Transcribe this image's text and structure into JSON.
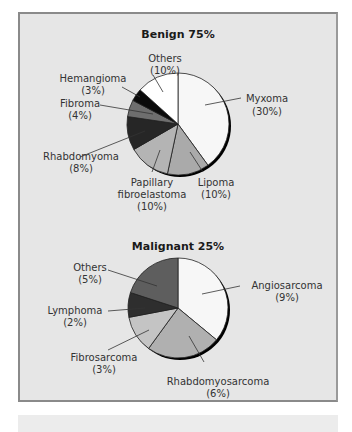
{
  "chart_data": [
    {
      "type": "pie",
      "title": "Benign 75%",
      "start_angle": "12 o'clock, clockwise",
      "categories": [
        "Myxoma",
        "Lipoma",
        "Papillary fibroelastoma",
        "Rhabdomyoma",
        "Fibroma",
        "Hemangioma",
        "Others"
      ],
      "values": [
        30,
        10,
        10,
        8,
        4,
        3,
        10
      ],
      "labels": [
        "(30%)",
        "(10%)",
        "(10%)",
        "(8%)",
        "(4%)",
        "(3%)",
        "(10%)"
      ],
      "colors": [
        "#f7f7f7",
        "#aaaaaa",
        "#b4b4b4",
        "#262626",
        "#6e6e6e",
        "#0a0a0a",
        "#ffffff"
      ]
    },
    {
      "type": "pie",
      "title": "Malignant 25%",
      "start_angle": "12 o'clock, clockwise",
      "categories": [
        "Angiosarcoma",
        "Rhabdomyosarcoma",
        "Fibrosarcoma",
        "Lymphoma",
        "Others"
      ],
      "values": [
        9,
        6,
        3,
        2,
        5
      ],
      "labels": [
        "(9%)",
        "(6%)",
        "(3%)",
        "(2%)",
        "(5%)"
      ],
      "colors": [
        "#f7f7f7",
        "#b0b0b0",
        "#c4c4c4",
        "#2e2e2e",
        "#5e5e5e"
      ]
    }
  ],
  "benign": {
    "title": "Benign 75%",
    "labels": {
      "others": [
        "Others",
        "(10%)"
      ],
      "hemangioma": [
        "Hemangioma",
        "(3%)"
      ],
      "fibroma": [
        "Fibroma",
        "(4%)"
      ],
      "rhabdomyoma": [
        "Rhabdomyoma",
        "(8%)"
      ],
      "papillary": [
        "Papillary",
        "fibroelastoma",
        "(10%)"
      ],
      "lipoma": [
        "Lipoma",
        "(10%)"
      ],
      "myxoma": [
        "Myxoma",
        "(30%)"
      ]
    }
  },
  "malignant": {
    "title": "Malignant 25%",
    "labels": {
      "others": [
        "Others",
        "(5%)"
      ],
      "lymphoma": [
        "Lymphoma",
        "(2%)"
      ],
      "fibrosarcoma": [
        "Fibrosarcoma",
        "(3%)"
      ],
      "rhabdomyosarcoma": [
        "Rhabdomyosarcoma",
        "(6%)"
      ],
      "angiosarcoma": [
        "Angiosarcoma",
        "(9%)"
      ]
    }
  }
}
